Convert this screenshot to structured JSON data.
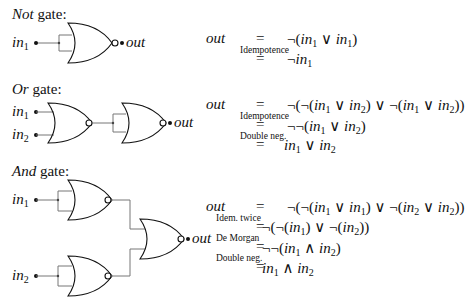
{
  "sections": [
    {
      "id": "not",
      "title_italic": "Not",
      "title_rest": " gate:",
      "inputs": [
        "in1"
      ],
      "output": "out",
      "derivation": [
        {
          "lhs": "out",
          "rel": "=",
          "note": "",
          "rhs": "¬(in1 ∨ in1)"
        },
        {
          "lhs": "",
          "rel": "=",
          "note": "Idempotence",
          "rhs": "¬in1"
        }
      ]
    },
    {
      "id": "or",
      "title_italic": "Or",
      "title_rest": " gate:",
      "inputs": [
        "in1",
        "in2"
      ],
      "output": "out",
      "derivation": [
        {
          "lhs": "out",
          "rel": "=",
          "note": "",
          "rhs": "¬(¬(in1 ∨ in2) ∨ ¬(in1 ∨ in2))"
        },
        {
          "lhs": "",
          "rel": "=",
          "note": "Idempotence",
          "rhs": "¬¬(in1 ∨ in2)"
        },
        {
          "lhs": "",
          "rel": "=",
          "note": "Double neg.",
          "rhs": "in1 ∨ in2"
        }
      ]
    },
    {
      "id": "and",
      "title_italic": "And",
      "title_rest": " gate:",
      "inputs": [
        "in1",
        "in2"
      ],
      "output": "out",
      "derivation": [
        {
          "lhs": "out",
          "rel": "=",
          "note": "",
          "rhs": "¬(¬(in1 ∨ in1) ∨ ¬(in2 ∨ in2))"
        },
        {
          "lhs": "",
          "rel": "=",
          "note": "Idem. twice",
          "rhs": "¬(¬(in1) ∨ ¬(in2))"
        },
        {
          "lhs": "",
          "rel": "=",
          "note": "De Morgan",
          "rhs": "¬¬(in1 ∧ in2)"
        },
        {
          "lhs": "",
          "rel": "=",
          "note": "Double neg.",
          "rhs": "in1 ∧ in2"
        }
      ]
    }
  ],
  "labels": {
    "in": "in",
    "sub1": "1",
    "sub2": "2",
    "out": "out",
    "eq": "=",
    "neg": "¬",
    "or": "∨",
    "and": "∧"
  }
}
